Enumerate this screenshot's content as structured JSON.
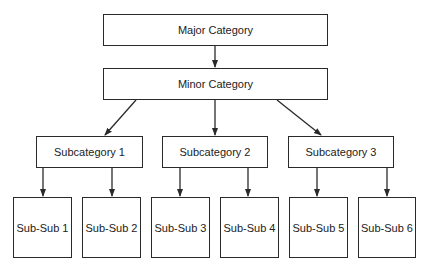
{
  "diagram": {
    "major": {
      "label": "Major Category"
    },
    "minor": {
      "label": "Minor Category"
    },
    "subcategories": [
      {
        "label": "Subcategory 1"
      },
      {
        "label": "Subcategory 2"
      },
      {
        "label": "Subcategory 3"
      }
    ],
    "subsubs": [
      {
        "label": "Sub-Sub 1"
      },
      {
        "label": "Sub-Sub 2"
      },
      {
        "label": "Sub-Sub 3"
      },
      {
        "label": "Sub-Sub 4"
      },
      {
        "label": "Sub-Sub 5"
      },
      {
        "label": "Sub-Sub 6"
      }
    ],
    "colors": {
      "stroke": "#2a2a2a",
      "background": "#ffffff",
      "text": "#222222"
    }
  }
}
